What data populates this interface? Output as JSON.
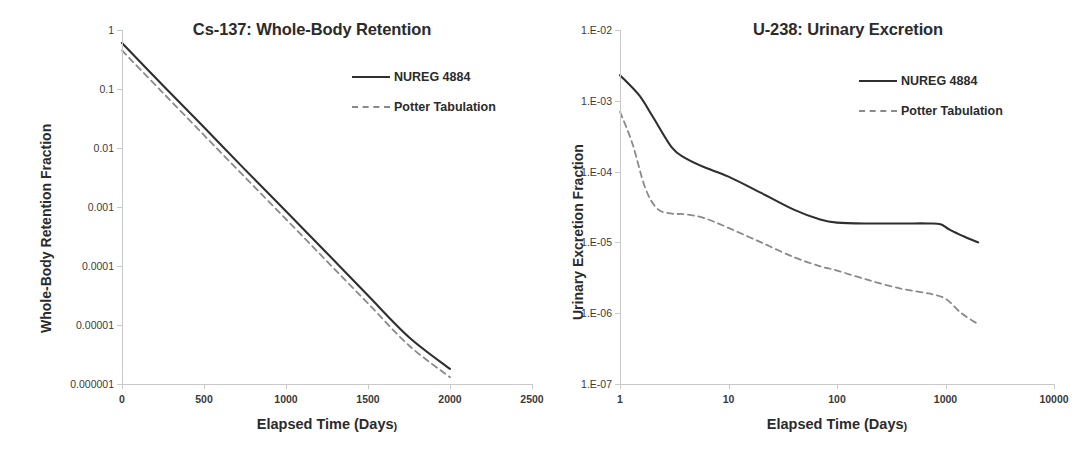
{
  "figure": {
    "panels": [
      {
        "id": "cs137",
        "title": "Cs-137: Whole-Body Retention",
        "xlabel_main": "Elapsed Time (Days",
        "xlabel_tail": ")",
        "ylabel": "Whole-Body Retention Fraction",
        "x_ticks": [
          "0",
          "500",
          "1000",
          "1500",
          "2000",
          "2500"
        ],
        "y_ticks": [
          "1",
          "0.1",
          "0.01",
          "0.001",
          "0.0001",
          "0.00001",
          "0.000001"
        ],
        "legend": [
          {
            "label": "NUREG 4884",
            "style": "solid",
            "color": "#2f2f2f"
          },
          {
            "label": "Potter Tabulation",
            "style": "dashed",
            "color": "#8a8a8a"
          }
        ]
      },
      {
        "id": "u238",
        "title": "U-238: Urinary Excretion",
        "xlabel_main": "Elapsed Time (Days",
        "xlabel_tail": ")",
        "ylabel": "Urinary Excretion Fraction",
        "x_ticks": [
          "1",
          "10",
          "100",
          "1000",
          "10000"
        ],
        "y_ticks": [
          "1.E-02",
          "1.E-03",
          "1.E-04",
          "1.E-05",
          "1.E-06",
          "1.E-07"
        ],
        "legend": [
          {
            "label": "NUREG 4884",
            "style": "solid",
            "color": "#2f2f2f"
          },
          {
            "label": "Potter Tabulation",
            "style": "dashed",
            "color": "#8a8a8a"
          }
        ]
      }
    ]
  },
  "chart_data": [
    {
      "type": "line",
      "id": "cs137",
      "title": "Cs-137: Whole-Body Retention",
      "xlabel": "Elapsed Time (Days)",
      "ylabel": "Whole-Body Retention Fraction",
      "xscale": "linear",
      "yscale": "log",
      "xlim": [
        0,
        2500
      ],
      "ylim": [
        1e-06,
        1
      ],
      "xticks": [
        0,
        500,
        1000,
        1500,
        2000,
        2500
      ],
      "yticks": [
        1,
        0.1,
        0.01,
        0.001,
        0.0001,
        1e-05,
        1e-06
      ],
      "grid": false,
      "legend_position": "upper right",
      "series": [
        {
          "name": "NUREG 4884",
          "style": "solid",
          "color": "#2f2f2f",
          "x": [
            0,
            250,
            500,
            750,
            1000,
            1250,
            1500,
            1750,
            2000
          ],
          "y": [
            0.6,
            0.115,
            0.0225,
            0.0043,
            0.00085,
            0.000165,
            3.15e-05,
            6.2e-06,
            1.8e-06
          ]
        },
        {
          "name": "Potter Tabulation",
          "style": "dashed",
          "color": "#8a8a8a",
          "x": [
            0,
            250,
            500,
            750,
            1000,
            1250,
            1500,
            1750,
            2000
          ],
          "y": [
            0.45,
            0.086,
            0.0165,
            0.0032,
            0.00062,
            0.00012,
            2.32e-05,
            4.5e-06,
            1.3e-06
          ]
        }
      ]
    },
    {
      "type": "line",
      "id": "u238",
      "title": "U-238: Urinary Excretion",
      "xlabel": "Elapsed Time (Days)",
      "ylabel": "Urinary Excretion Fraction",
      "xscale": "log",
      "yscale": "log",
      "xlim": [
        1,
        10000
      ],
      "ylim": [
        1e-07,
        0.01
      ],
      "xticks": [
        1,
        10,
        100,
        1000,
        10000
      ],
      "yticks": [
        0.01,
        0.001,
        0.0001,
        1e-05,
        1e-06,
        1e-07
      ],
      "grid": false,
      "legend_position": "upper right",
      "series": [
        {
          "name": "NUREG 4884",
          "style": "solid",
          "color": "#2f2f2f",
          "x": [
            1,
            1.5,
            2,
            3,
            4,
            6,
            10,
            20,
            40,
            70,
            100,
            200,
            400,
            700,
            900,
            1100,
            1500,
            2000
          ],
          "y": [
            0.0023,
            0.0012,
            0.0006,
            0.00022,
            0.000155,
            0.000115,
            8.5e-05,
            5e-05,
            2.9e-05,
            2.1e-05,
            1.9e-05,
            1.85e-05,
            1.85e-05,
            1.85e-05,
            1.8e-05,
            1.5e-05,
            1.2e-05,
            1e-05
          ]
        },
        {
          "name": "Potter Tabulation",
          "style": "dashed",
          "color": "#8a8a8a",
          "x": [
            1,
            1.3,
            1.7,
            2.2,
            3,
            4,
            6,
            10,
            20,
            40,
            70,
            100,
            200,
            400,
            700,
            1000,
            1400,
            2000
          ],
          "y": [
            0.0007,
            0.00025,
            6e-05,
            3e-05,
            2.55e-05,
            2.5e-05,
            2.2e-05,
            1.6e-05,
            1e-05,
            6.2e-06,
            4.6e-06,
            4e-06,
            2.9e-06,
            2.2e-06,
            1.9e-06,
            1.6e-06,
            1e-06,
            7e-07
          ]
        }
      ]
    }
  ]
}
